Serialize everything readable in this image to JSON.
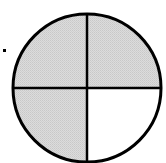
{
  "diagram": {
    "type": "fraction-circle",
    "total_parts": 4,
    "shaded_parts": 3,
    "fraction_shaded": "3/4",
    "quadrants": [
      {
        "position": "top-left",
        "shaded": true
      },
      {
        "position": "top-right",
        "shaded": true
      },
      {
        "position": "bottom-right",
        "shaded": false
      },
      {
        "position": "bottom-left",
        "shaded": true
      }
    ],
    "colors": {
      "shaded_fill": "#d6d6d6",
      "unshaded_fill": "#ffffff",
      "stroke": "#000000",
      "marker": "#000000"
    },
    "geometry": {
      "cx": 87,
      "cy": 88,
      "r": 74,
      "stroke_width": 3
    },
    "marker": {
      "x": 4,
      "y": 50,
      "size": 3
    }
  }
}
